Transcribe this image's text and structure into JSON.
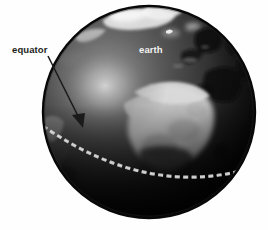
{
  "figure": {
    "type": "illustration",
    "background_color": "#fefefe",
    "width": 268,
    "height": 230
  },
  "labels": {
    "callout": {
      "text": "equator",
      "color": "#231f20",
      "x": 12,
      "y": 53,
      "pointer": {
        "icon": "arrow-icon",
        "from_x": 48,
        "from_y": 56,
        "to_x": 83,
        "to_y": 127,
        "color": "#1a1a1a"
      }
    },
    "globe": {
      "text": "earth",
      "color": "#f2f2f2",
      "x": 139,
      "y": 53
    }
  },
  "globe": {
    "center_x": 149,
    "center_y": 112,
    "radius": 107,
    "rim_color": "#0c0c0c",
    "ocean_dark": "#141414",
    "ocean_mid": "#3a3a3a",
    "highlight_color": "#d8d8d8",
    "highlight_x": 105,
    "highlight_y": 86,
    "land_light": "#cfcfcf",
    "land_bright": "#e8e8e8",
    "land_dark": "#0a0a0a"
  },
  "equator_line": {
    "name": "equator",
    "style": "dashed",
    "color": "#c9c9c9",
    "dash_length": 5,
    "dash_gap": 3,
    "stroke_width": 3.2,
    "start_x": 44,
    "start_y": 126,
    "control_x": 150,
    "control_y": 200,
    "end_x": 254,
    "end_y": 168
  },
  "features": [
    {
      "name": "greenland-arctic",
      "tone": "light"
    },
    {
      "name": "scandinavia-europe",
      "tone": "dark"
    },
    {
      "name": "africa-sahara",
      "tone": "bright"
    },
    {
      "name": "middle-east-arabia",
      "tone": "dark"
    },
    {
      "name": "south-america-edge",
      "tone": "dark"
    },
    {
      "name": "cloud-band-north-atlantic",
      "tone": "light"
    }
  ]
}
